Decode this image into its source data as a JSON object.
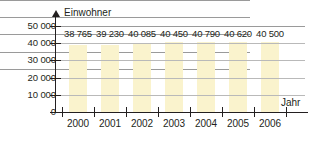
{
  "chart_data": {
    "type": "bar",
    "title": "",
    "xlabel": "Jahr",
    "ylabel": "Einwohner",
    "categories": [
      "2000",
      "2001",
      "2002",
      "2003",
      "2004",
      "2005",
      "2006"
    ],
    "values": [
      38765,
      39230,
      40085,
      40450,
      40790,
      40620,
      40500
    ],
    "value_labels": [
      "38 765",
      "39 230",
      "40 085",
      "40 450",
      "40 790",
      "40 620",
      "40 500"
    ],
    "ylim": [
      0,
      50000
    ],
    "yticks": [
      0,
      10000,
      20000,
      30000,
      40000,
      50000
    ],
    "ytick_labels": [
      "0",
      "10 000",
      "20 000",
      "30 000",
      "40 000",
      "50 000"
    ],
    "grid": true,
    "legend": null,
    "bar_color": "#faf3cd",
    "axis_color": "#231f20",
    "grid_color": "#9a9a9a"
  }
}
